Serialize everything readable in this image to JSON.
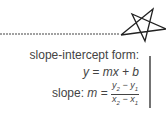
{
  "notes": {
    "title": "slope-intercept form:",
    "formula": "y = mx + b",
    "slope_label": "slope: ",
    "slope_var": "m",
    "slope_eq": " = ",
    "numerator": "y",
    "numerator_sub2": "2",
    "numerator_minus": " − y",
    "numerator_sub1": "1",
    "denominator": "x",
    "denominator_sub2": "2",
    "denominator_minus": " − x",
    "denominator_sub1": "1"
  },
  "colors": {
    "ink": "#333333",
    "background": "#ffffff"
  }
}
